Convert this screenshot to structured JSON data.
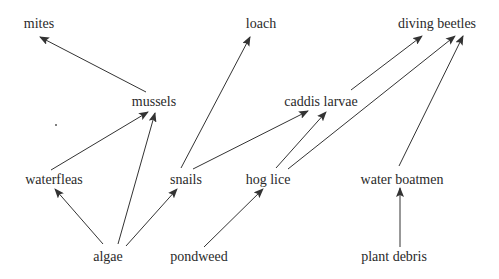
{
  "diagram": {
    "title": "",
    "type": "food web",
    "colors": {
      "text": "#2a2a2a",
      "arrow": "#333333",
      "background": "#ffffff"
    },
    "nodes": {
      "mites": {
        "label": "mites",
        "x": 39,
        "y": 24
      },
      "loach": {
        "label": "loach",
        "x": 261,
        "y": 24
      },
      "diving_beetles": {
        "label": "diving beetles",
        "x": 437,
        "y": 24
      },
      "mussels": {
        "label": "mussels",
        "x": 154,
        "y": 102
      },
      "caddis_larvae": {
        "label": "caddis larvae",
        "x": 321,
        "y": 102
      },
      "waterfleas": {
        "label": "waterfleas",
        "x": 54,
        "y": 180
      },
      "snails": {
        "label": "snails",
        "x": 186,
        "y": 180
      },
      "hog_lice": {
        "label": "hog lice",
        "x": 268,
        "y": 180
      },
      "water_boatmen": {
        "label": "water boatmen",
        "x": 402,
        "y": 180
      },
      "algae": {
        "label": "algae",
        "x": 108,
        "y": 257
      },
      "pondweed": {
        "label": "pondweed",
        "x": 199,
        "y": 257
      },
      "plant_debris": {
        "label": "plant debris",
        "x": 394,
        "y": 257
      }
    },
    "edges": [
      {
        "from": "mussels",
        "to": "mites",
        "x1": 146,
        "y1": 92,
        "x2": 40,
        "y2": 37
      },
      {
        "from": "snails",
        "to": "loach",
        "x1": 181,
        "y1": 168,
        "x2": 250,
        "y2": 37
      },
      {
        "from": "caddis_larvae",
        "to": "diving_beetles",
        "x1": 351,
        "y1": 90,
        "x2": 422,
        "y2": 36
      },
      {
        "from": "hog_lice",
        "to": "diving_beetles",
        "x1": 288,
        "y1": 169,
        "x2": 455,
        "y2": 36
      },
      {
        "from": "water_boatmen",
        "to": "diving_beetles",
        "x1": 399,
        "y1": 166,
        "x2": 463,
        "y2": 36
      },
      {
        "from": "waterfleas",
        "to": "mussels",
        "x1": 51,
        "y1": 170,
        "x2": 148,
        "y2": 112
      },
      {
        "from": "algae",
        "to": "mussels",
        "x1": 118,
        "y1": 244,
        "x2": 155,
        "y2": 113
      },
      {
        "from": "snails",
        "to": "caddis_larvae",
        "x1": 193,
        "y1": 169,
        "x2": 308,
        "y2": 111
      },
      {
        "from": "hog_lice",
        "to": "caddis_larvae",
        "x1": 276,
        "y1": 168,
        "x2": 326,
        "y2": 112
      },
      {
        "from": "algae",
        "to": "waterfleas",
        "x1": 103,
        "y1": 244,
        "x2": 55,
        "y2": 189
      },
      {
        "from": "algae",
        "to": "snails",
        "x1": 126,
        "y1": 246,
        "x2": 177,
        "y2": 189
      },
      {
        "from": "pondweed",
        "to": "hog_lice",
        "x1": 204,
        "y1": 247,
        "x2": 263,
        "y2": 189
      },
      {
        "from": "plant_debris",
        "to": "water_boatmen",
        "x1": 400,
        "y1": 247,
        "x2": 400,
        "y2": 188
      }
    ],
    "specks": [
      {
        "x": 55,
        "y": 124
      }
    ]
  }
}
